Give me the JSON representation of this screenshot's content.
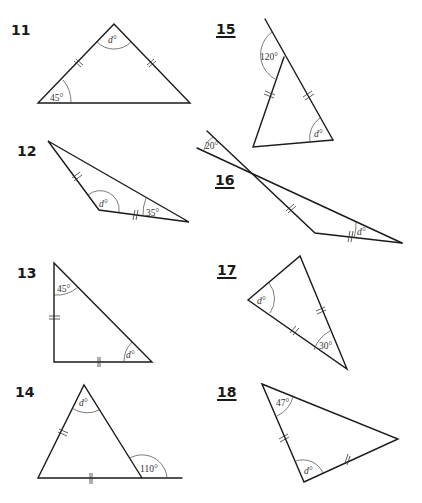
{
  "problems": [
    {
      "number": "11",
      "underlined": false,
      "given": "45°",
      "unknown": "d°"
    },
    {
      "number": "12",
      "underlined": false,
      "given": "35°",
      "unknown": "d°"
    },
    {
      "number": "13",
      "underlined": false,
      "given": "45°",
      "unknown": "d°"
    },
    {
      "number": "14",
      "underlined": false,
      "given": "110°",
      "unknown": "d°"
    },
    {
      "number": "15",
      "underlined": true,
      "given": "120°",
      "unknown": "d°"
    },
    {
      "number": "16",
      "underlined": true,
      "given": "20°",
      "unknown": "d°"
    },
    {
      "number": "17",
      "underlined": true,
      "given": "30°",
      "unknown": "d°"
    },
    {
      "number": "18",
      "underlined": true,
      "given": "47°",
      "unknown": "d°"
    }
  ]
}
